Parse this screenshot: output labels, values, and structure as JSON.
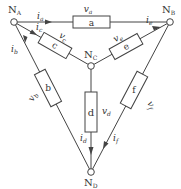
{
  "diagram": {
    "type": "circuit-graph",
    "nodes": [
      {
        "id": "A",
        "label": "N",
        "sub": "A"
      },
      {
        "id": "B",
        "label": "N",
        "sub": "B"
      },
      {
        "id": "C",
        "label": "N",
        "sub": "C"
      },
      {
        "id": "D",
        "label": "N",
        "sub": "D"
      }
    ],
    "branches": [
      {
        "id": "a",
        "name": "a",
        "from": "A",
        "to": "B",
        "voltage": "v",
        "voltage_sub": "a",
        "current": "i",
        "current_sub": "a"
      },
      {
        "id": "b",
        "name": "b",
        "from": "D",
        "to": "A",
        "voltage": "v",
        "voltage_sub": "b",
        "current": "i",
        "current_sub": "b"
      },
      {
        "id": "c",
        "name": "c",
        "from": "A",
        "to": "C",
        "voltage": "v",
        "voltage_sub": "c",
        "current": "i",
        "current_sub": "c"
      },
      {
        "id": "d",
        "name": "d",
        "from": "C",
        "to": "D",
        "voltage": "v",
        "voltage_sub": "d",
        "current": "i",
        "current_sub": "d"
      },
      {
        "id": "e",
        "name": "e",
        "from": "C",
        "to": "B",
        "voltage": "v",
        "voltage_sub": "e",
        "current": "i",
        "current_sub": "e"
      },
      {
        "id": "f",
        "name": "f",
        "from": "B",
        "to": "D",
        "voltage": "v",
        "voltage_sub": "f",
        "current": "i",
        "current_sub": "f"
      }
    ]
  }
}
